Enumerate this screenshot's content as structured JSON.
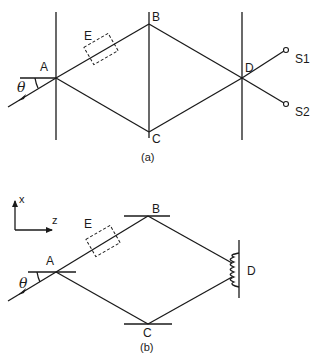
{
  "figure_a": {
    "caption": "(a)",
    "labels": {
      "A": "A",
      "B": "B",
      "C": "C",
      "D": "D",
      "E": "E",
      "theta": "θ",
      "S1": "S1",
      "S2": "S2"
    },
    "description": "Mach-Zehnder interferometer: beam enters at angle θ at beam splitter A, splits to mirrors B and C, recombines at D, outputs to detectors S1 and S2; element E in upper arm"
  },
  "figure_b": {
    "caption": "(b)",
    "labels": {
      "A": "A",
      "B": "B",
      "C": "C",
      "D": "D",
      "E": "E",
      "theta": "θ",
      "x_axis": "x",
      "z_axis": "z"
    },
    "description": "Interferometer with horizontal mirrors at A, B, C and an interference fringe pattern on screen D"
  },
  "colors": {
    "ink": "#1a1a1a",
    "background": "#ffffff"
  }
}
